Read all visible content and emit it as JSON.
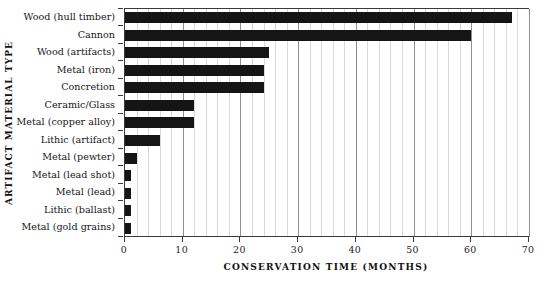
{
  "chart_data": {
    "type": "bar",
    "orientation": "horizontal",
    "title": "",
    "xlabel": "CONSERVATION TIME (MONTHS)",
    "ylabel": "ARTIFACT MATERIAL TYPE",
    "xlim": [
      0,
      70
    ],
    "ylim": null,
    "grid": true,
    "grid_axis": "x",
    "grid_minor_step": 2,
    "grid_major_step": 10,
    "legend": null,
    "bar_color": "#151515",
    "categories": [
      "Wood (hull timber)",
      "Cannon",
      "Wood (artifacts)",
      "Metal (iron)",
      "Concretion",
      "Ceramic/Glass",
      "Metal (copper alloy)",
      "Lithic (artifact)",
      "Metal (pewter)",
      "Metal (lead shot)",
      "Metal (lead)",
      "Lithic (ballast)",
      "Metal (gold grains)"
    ],
    "values": [
      67,
      60,
      25,
      24,
      24,
      12,
      12,
      6,
      2,
      1,
      1,
      1,
      1
    ],
    "xticks": [
      0,
      10,
      20,
      30,
      40,
      50,
      60,
      70
    ],
    "xtick_labels": [
      "0",
      "10",
      "20",
      "30",
      "40",
      "50",
      "60",
      "70"
    ]
  }
}
